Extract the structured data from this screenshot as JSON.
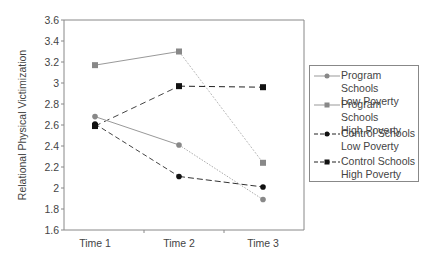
{
  "chart_data": {
    "type": "line",
    "title": "",
    "xlabel": "",
    "ylabel": "Relational Physical Victimization",
    "categories": [
      "Time 1",
      "Time 2",
      "Time 3"
    ],
    "ylim": [
      1.6,
      3.6
    ],
    "yticks": [
      "1.6",
      "1.8",
      "2",
      "2.2",
      "2.4",
      "2.6",
      "2.8",
      "3",
      "3.2",
      "3.4",
      "3.6"
    ],
    "grid": false,
    "legend_position": "right",
    "series": [
      {
        "name": "Program Schools Low Poverty",
        "values": [
          2.68,
          2.41,
          1.89
        ],
        "color": "#888888",
        "marker": "circle",
        "line": "solid"
      },
      {
        "name": "Program Schools High Poverty",
        "values": [
          3.17,
          3.3,
          2.24
        ],
        "color": "#888888",
        "marker": "square",
        "line": "solid-then-dotted"
      },
      {
        "name": "Control Schools Low Poverty",
        "values": [
          2.61,
          2.11,
          2.01
        ],
        "color": "#111111",
        "marker": "circle",
        "line": "dashed"
      },
      {
        "name": "Control Schools High Poverty",
        "values": [
          2.59,
          2.97,
          2.96
        ],
        "color": "#111111",
        "marker": "square",
        "line": "dashed"
      }
    ]
  },
  "legend": {
    "items": [
      {
        "line1": "Program Schools",
        "line2": "Low Poverty"
      },
      {
        "line1": "Program Schools",
        "line2": "High Poverty"
      },
      {
        "line1": "Control Schools",
        "line2": "Low Poverty"
      },
      {
        "line1": "Control Schools",
        "line2": "High Poverty"
      }
    ]
  }
}
